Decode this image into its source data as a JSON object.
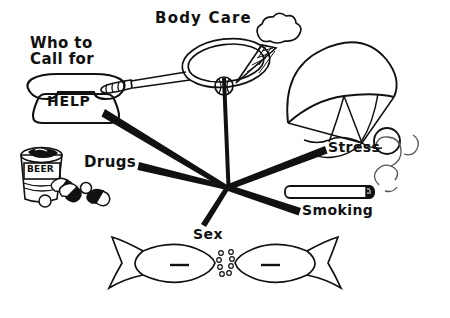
{
  "poster": {
    "title": "Health and wellness spoke diagram",
    "background_color": "#ffffff",
    "ink_color": "#111111",
    "width": 450,
    "height": 318
  },
  "labels": {
    "body_care": "Body Care",
    "who_to_call_for": "Who to\nCall for",
    "help": "HELP",
    "drugs": "Drugs",
    "stress": "Stress",
    "smoking": "Smoking",
    "sex": "Sex",
    "beer": "BEER"
  },
  "labels_flat": {
    "body_care": "Body Care",
    "who_to_call_line1": "Who to",
    "who_to_call_line2": "Call for",
    "help": "HELP",
    "drugs": "Drugs",
    "stress": "Stress",
    "smoking": "Smoking",
    "sex": "Sex",
    "beer": "BEER"
  },
  "hub": {
    "x": 228,
    "y": 187
  },
  "spokes": [
    {
      "name": "spoke-help",
      "label": "HELP",
      "x1": 228,
      "y1": 187,
      "x2": 104,
      "y2": 113
    },
    {
      "name": "spoke-bodycare",
      "label": "Body Care",
      "x1": 228,
      "y1": 187,
      "x2": 224,
      "y2": 78
    },
    {
      "name": "spoke-drugs",
      "label": "Drugs",
      "x1": 228,
      "y1": 187,
      "x2": 138,
      "y2": 166
    },
    {
      "name": "spoke-stress",
      "label": "Stress",
      "x1": 228,
      "y1": 187,
      "x2": 324,
      "y2": 150
    },
    {
      "name": "spoke-smoking",
      "label": "Smoking",
      "x1": 228,
      "y1": 187,
      "x2": 300,
      "y2": 212
    },
    {
      "name": "spoke-sex",
      "label": "Sex",
      "x1": 228,
      "y1": 187,
      "x2": 203,
      "y2": 226
    }
  ],
  "illustrations": [
    {
      "name": "telephone-illustration",
      "topic": "HELP"
    },
    {
      "name": "tennis-racket-illustration",
      "topic": "Body Care"
    },
    {
      "name": "ice-cream-cone-illustration",
      "topic": "Body Care"
    },
    {
      "name": "parachute-illustration",
      "topic": "Stress"
    },
    {
      "name": "beer-can-illustration",
      "topic": "Drugs"
    },
    {
      "name": "pills-illustration",
      "topic": "Drugs"
    },
    {
      "name": "cigarette-illustration",
      "topic": "Smoking"
    },
    {
      "name": "smoke-wisp-illustration",
      "topic": "Smoking"
    },
    {
      "name": "kissing-fish-illustration",
      "topic": "Sex"
    }
  ]
}
